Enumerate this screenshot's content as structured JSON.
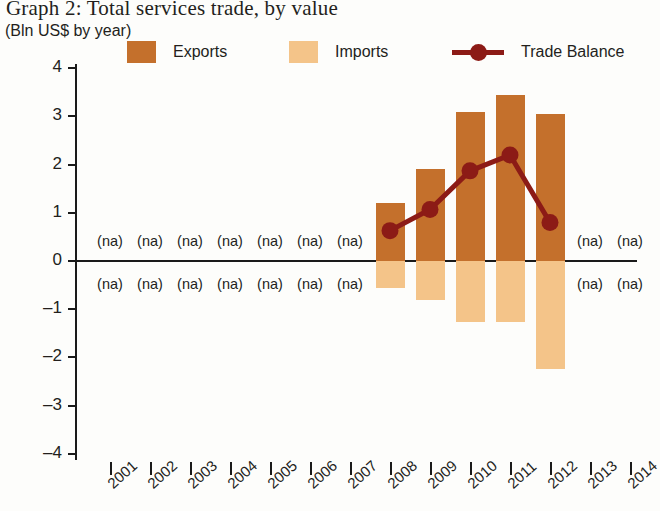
{
  "header": {
    "title": "Graph 2: Total services trade, by value",
    "subtitle": "(Bln US$ by year)"
  },
  "legend": {
    "entries": [
      {
        "label": "Exports",
        "color": "#c4702c",
        "marker": "square-swatch"
      },
      {
        "label": "Imports",
        "color": "#f4c489",
        "marker": "square-swatch"
      },
      {
        "label": "Trade Balance",
        "color": "#8c1b16",
        "marker": "line-with-dot"
      }
    ]
  },
  "axes": {
    "y_ticks": [
      "4",
      "3",
      "2",
      "1",
      "0",
      "–1",
      "–2",
      "–3",
      "–4"
    ],
    "x_ticks": [
      "2001",
      "2002",
      "2003",
      "2004",
      "2005",
      "2006",
      "2007",
      "2008",
      "2009",
      "2010",
      "2011",
      "2012",
      "2013",
      "2014"
    ]
  },
  "na_label": "(na)",
  "chart_data": {
    "type": "bar",
    "title": "Graph 2: Total services trade, by value",
    "subtitle": "(Bln US$ by year)",
    "xlabel": "",
    "ylabel": "Bln US$",
    "ylim": [
      -4,
      4
    ],
    "grid": false,
    "legend_position": "top",
    "categories": [
      "2001",
      "2002",
      "2003",
      "2004",
      "2005",
      "2006",
      "2007",
      "2008",
      "2009",
      "2010",
      "2011",
      "2012",
      "2013",
      "2014"
    ],
    "series": [
      {
        "name": "Exports",
        "type": "bar",
        "color": "#c4702c",
        "values": [
          null,
          null,
          null,
          null,
          null,
          null,
          null,
          1.2,
          1.9,
          3.1,
          3.45,
          3.05,
          null,
          null
        ]
      },
      {
        "name": "Imports",
        "type": "bar",
        "color": "#f4c489",
        "values": [
          null,
          null,
          null,
          null,
          null,
          null,
          null,
          -0.57,
          -0.8,
          -1.27,
          -1.27,
          -2.25,
          null,
          null
        ]
      },
      {
        "name": "Trade Balance",
        "type": "line",
        "color": "#8c1b16",
        "values": [
          null,
          null,
          null,
          null,
          null,
          null,
          null,
          0.63,
          1.07,
          1.87,
          2.2,
          0.8,
          null,
          null
        ]
      }
    ],
    "missing_data_marker": "(na)",
    "missing_years": [
      "2001",
      "2002",
      "2003",
      "2004",
      "2005",
      "2006",
      "2007",
      "2013",
      "2014"
    ]
  }
}
